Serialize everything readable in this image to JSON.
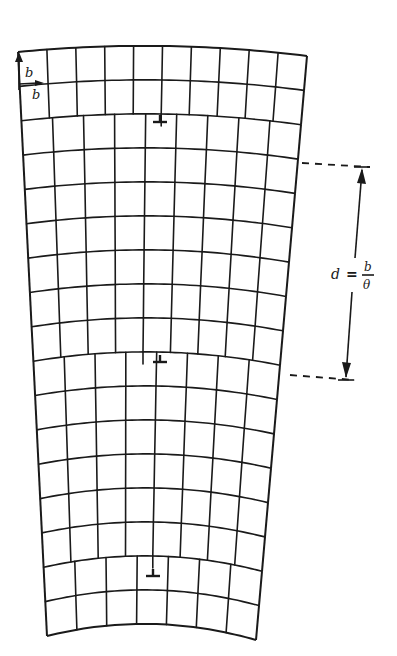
{
  "figure": {
    "labels": {
      "burgers_vertical": "b",
      "burgers_horizontal": "b",
      "spacing_lhs": "d",
      "spacing_eq": "=",
      "spacing_num": "b",
      "spacing_den": "θ"
    },
    "grid": {
      "rows": 17,
      "top_columns": 10,
      "bottom_columns": 7,
      "top_left": [
        18,
        52
      ],
      "top_right": [
        307,
        56
      ],
      "top_bulge": 8,
      "bottom_left": [
        47,
        636
      ],
      "bottom_right": [
        256,
        640
      ],
      "bottom_bulge": 14
    },
    "dislocations": [
      {
        "symbol": "⊥",
        "x": 160,
        "y": 122
      },
      {
        "symbol": "⊥",
        "x": 160,
        "y": 362
      },
      {
        "symbol": "⊥",
        "x": 153,
        "y": 576
      }
    ],
    "dimension": {
      "top_y": 167,
      "bottom_y": 380,
      "x_top": 362,
      "x_bottom": 346
    },
    "colors": {
      "ink": "#1a1a1a",
      "background": "#ffffff"
    }
  }
}
